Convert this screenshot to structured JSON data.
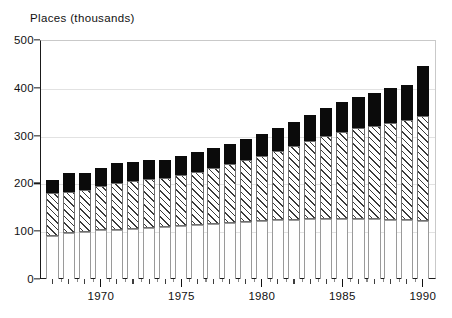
{
  "chart_data": {
    "type": "bar",
    "subtype": "stacked-bar",
    "title": "Places (thousands)",
    "xlabel": "",
    "ylabel": "Places (thousands)",
    "ylim": [
      0,
      500
    ],
    "y_ticks": [
      0,
      100,
      200,
      300,
      400,
      500
    ],
    "y_tick_labels": [
      "0",
      "100",
      "200",
      "300",
      "400",
      "500"
    ],
    "grid": true,
    "grid_axis": "y",
    "legend": null,
    "legend_position": "none",
    "x_tick_labels": [
      "1970",
      "1975",
      "1980",
      "1985",
      "1990"
    ],
    "x_tick_values": [
      1970,
      1975,
      1980,
      1985,
      1990
    ],
    "categories": [
      "1967",
      "1968",
      "1969",
      "1970",
      "1971",
      "1972",
      "1973",
      "1974",
      "1975",
      "1976",
      "1977",
      "1978",
      "1979",
      "1980",
      "1981",
      "1982",
      "1983",
      "1984",
      "1985",
      "1986",
      "1987",
      "1988",
      "1989",
      "1990"
    ],
    "series": [
      {
        "name": "bottom-segment",
        "fill": "white",
        "color": "#ffffff",
        "values": [
          90,
          97,
          99,
          102,
          103,
          104,
          106,
          108,
          110,
          112,
          115,
          118,
          120,
          122,
          123,
          124,
          125,
          126,
          126,
          126,
          125,
          124,
          123,
          122
        ]
      },
      {
        "name": "middle-segment",
        "fill": "hatched",
        "color": "#3a3a3a",
        "values": [
          90,
          86,
          87,
          92,
          98,
          101,
          103,
          104,
          108,
          112,
          117,
          122,
          128,
          136,
          145,
          154,
          164,
          173,
          182,
          190,
          196,
          203,
          209,
          218
        ]
      },
      {
        "name": "top-segment",
        "fill": "solid-black",
        "color": "#0b0b0b",
        "values": [
          28,
          38,
          35,
          38,
          42,
          40,
          39,
          38,
          40,
          42,
          42,
          42,
          44,
          46,
          48,
          51,
          54,
          58,
          62,
          65,
          69,
          72,
          74,
          105
        ]
      }
    ],
    "totals": [
      208,
      221,
      221,
      232,
      243,
      245,
      248,
      250,
      258,
      266,
      274,
      282,
      292,
      304,
      316,
      329,
      343,
      357,
      370,
      381,
      390,
      399,
      406,
      445
    ],
    "bar_count": 24
  },
  "axes": {
    "y_title": "Places (thousands)"
  }
}
